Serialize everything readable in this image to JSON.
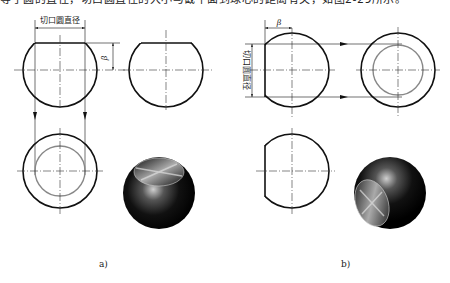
{
  "header": {
    "cut_off_text": "等于圆的直径，切口圆直径的大小与截平面到球心的距离有关，如图2-29所示。"
  },
  "figure": {
    "colors": {
      "outline": "#111111",
      "inner_circle": "#888888",
      "center_line": "#333333",
      "sphere_dark": "#000000",
      "sphere_highlight": "#d8d8d8"
    },
    "panel_a": {
      "caption": "a)",
      "dimension_label": "切口圆直径",
      "angle_label": "β"
    },
    "panel_b": {
      "caption": "b)",
      "dimension_label": "切口圆直径",
      "angle_label": "β"
    }
  }
}
